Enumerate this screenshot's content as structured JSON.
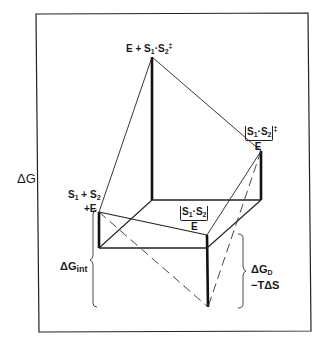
{
  "diagram": {
    "axis_label": "ΔG",
    "nodes": {
      "transition_state_free": {
        "label_main": "E + S",
        "label_sub1": "1",
        "label_dot": "·S",
        "label_sub2": "2",
        "label_sup": "‡"
      },
      "transition_state_complex": {
        "label_bracket": "S1·S2",
        "label_sub1": "1",
        "label_sub2": "2",
        "label_sup": "‡",
        "label_below": "E"
      },
      "substrates_free": {
        "line1_s": "S",
        "line1_sub1": "1",
        "line1_plus": " + S",
        "line1_sub2": "2",
        "line2": "+E"
      },
      "substrates_bound": {
        "label_bracket": "S1·S2",
        "label_sub1": "1",
        "label_sub2": "2",
        "label_below": "E"
      }
    },
    "braces": {
      "left": {
        "label_main": "ΔG",
        "label_sub": "int"
      },
      "right": {
        "line1_main": "ΔG",
        "line1_sub": "D",
        "line2": "−TΔS"
      }
    }
  }
}
